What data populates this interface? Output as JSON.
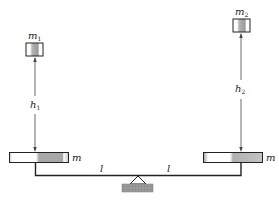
{
  "diagram": {
    "type": "balance-lever",
    "colors": {
      "line": "#222222",
      "plate_fill": "#ffffff",
      "plate_shade": "#a8a8a8",
      "block_shade": "#9a9a9a",
      "base_fill": "#8c8c8c"
    },
    "masses": {
      "left_block": {
        "label": "m",
        "subscript": "1"
      },
      "right_block": {
        "label": "m",
        "subscript": "2"
      },
      "left_plate": {
        "label": "m"
      },
      "right_plate": {
        "label": "m"
      }
    },
    "heights": {
      "left": {
        "label": "h",
        "subscript": "1"
      },
      "right": {
        "label": "h",
        "subscript": "2"
      }
    },
    "arms": {
      "left": {
        "label": "l"
      },
      "right": {
        "label": "l"
      }
    }
  }
}
